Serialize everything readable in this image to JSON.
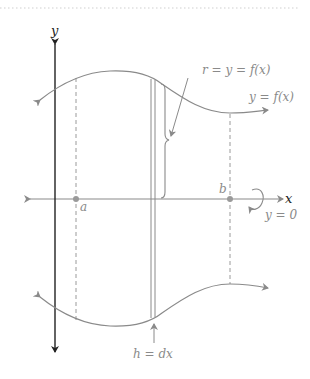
{
  "diagram": {
    "labels": {
      "y_axis": "y",
      "x_axis": "x",
      "point_a": "a",
      "point_b": "b",
      "radius": "r = y = f(x)",
      "curve": "y = f(x)",
      "height": "h = dx",
      "rotation_axis": "y = 0"
    },
    "colors": {
      "axis": "#222222",
      "curve": "#8a8a8a",
      "guide": "#9a9a9a",
      "border_dots": "#d0d0d0"
    }
  }
}
